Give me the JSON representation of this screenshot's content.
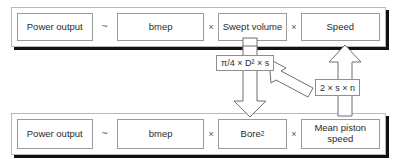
{
  "diagram": {
    "top_equation": {
      "terms": [
        {
          "id": "power-output",
          "label": "Power output"
        },
        {
          "id": "bmep",
          "label": "bmep"
        },
        {
          "id": "swept-volume",
          "label": "Swept volume"
        },
        {
          "id": "speed",
          "label": "Speed"
        }
      ],
      "operators": {
        "proportional": "~",
        "times": "×"
      }
    },
    "bottom_equation": {
      "terms": [
        {
          "id": "power-output",
          "label": "Power output"
        },
        {
          "id": "bmep",
          "label": "bmep"
        },
        {
          "id": "bore-squared",
          "label": "Bore",
          "superscript": "2"
        },
        {
          "id": "mean-piston-speed",
          "label": "Mean piston speed"
        }
      ],
      "operators": {
        "proportional": "~",
        "times": "×"
      }
    },
    "substitutions": [
      {
        "id": "swept-volume-formula",
        "label": "π/4 × D² × s",
        "from": "Swept volume",
        "to": "Bore²",
        "direction": "down"
      },
      {
        "id": "speed-formula",
        "label": "2 × s × n",
        "from": "Mean piston speed",
        "to": "Speed",
        "direction": "up"
      }
    ],
    "colors": {
      "background": "#ffffff",
      "band_border": "#b9b9b9",
      "band_shadow": "#111111",
      "box_border": "#9a9a9a",
      "arrow_stroke": "#6f6f6f",
      "text": "#2b2b2b",
      "operator_text": "#555555"
    }
  }
}
